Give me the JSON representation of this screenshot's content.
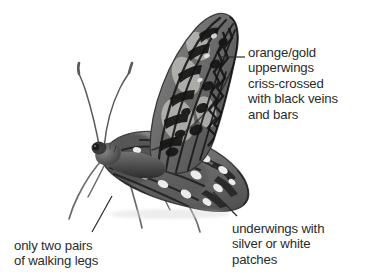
{
  "figure": {
    "style": "grayscale-halftone-illustration",
    "background_color": "#ffffff",
    "text_color": "#2b2b2b",
    "leader_line_color": "#2b2b2b"
  },
  "annotations": [
    {
      "id": "upperwings",
      "lines": [
        "orange/gold",
        "upperwings",
        "criss-crossed",
        "with black veins",
        "and bars"
      ],
      "leader": "horizontal",
      "points_to": "forewing-margin"
    },
    {
      "id": "underwings",
      "lines": [
        "underwings with",
        "silver or white",
        "patches"
      ],
      "leader": "diagonal-up-left",
      "points_to": "hindwing-underside"
    },
    {
      "id": "legs",
      "lines": [
        "only two pairs",
        "of walking legs"
      ],
      "leader": "diagonal-up-right",
      "points_to": "walking-legs"
    }
  ]
}
